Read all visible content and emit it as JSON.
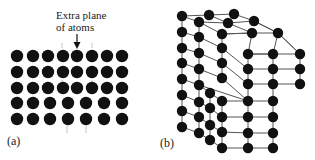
{
  "figure": {
    "panel_a": {
      "label": "(a)",
      "annotation_line1": "Extra plane",
      "annotation_line2": "of atoms",
      "rows_y": [
        56,
        72,
        88,
        103,
        119
      ],
      "upper_rows_x": [
        17,
        33,
        48,
        63,
        77,
        92,
        107,
        122
      ],
      "lower_rows_x": [
        17,
        33,
        50,
        68,
        86,
        104,
        122
      ],
      "upper_row_count": 3,
      "lower_row_count": 2,
      "atom_color": "#111111"
    },
    "panel_b": {
      "label": "(b)",
      "atom_color": "#111111",
      "bond_color": "#555555"
    }
  }
}
